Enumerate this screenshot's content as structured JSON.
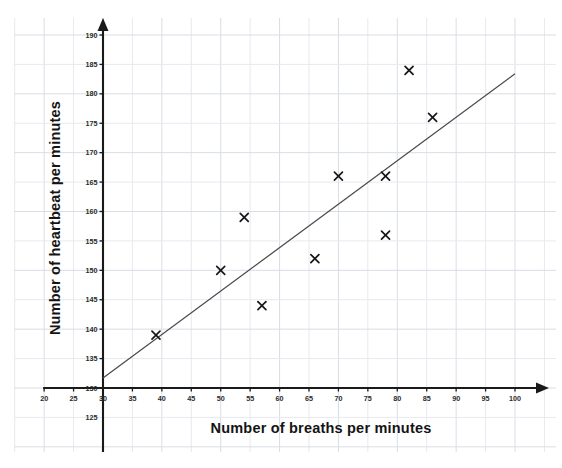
{
  "chart_data": {
    "type": "scatter",
    "title": "",
    "xlabel": "Number of breaths per minutes",
    "ylabel": "Number of heartbeat  per minutes",
    "xlim": [
      20,
      100
    ],
    "ylim": [
      125,
      190
    ],
    "x_ticks": [
      20,
      25,
      30,
      35,
      40,
      45,
      50,
      55,
      60,
      65,
      70,
      75,
      80,
      85,
      90,
      95,
      100
    ],
    "y_ticks": [
      125,
      130,
      135,
      140,
      145,
      150,
      155,
      160,
      165,
      170,
      175,
      180,
      185,
      190
    ],
    "x_tick_labels": [
      "20",
      "25",
      "30",
      "35",
      "40",
      "45",
      "50",
      "55",
      "60",
      "65",
      "70",
      "75",
      "80",
      "85",
      "90",
      "95",
      "100"
    ],
    "y_tick_labels": [
      "125",
      "130",
      "135",
      "140",
      "145",
      "150",
      "155",
      "160",
      "165",
      "170",
      "175",
      "180",
      "185",
      "190"
    ],
    "grid": true,
    "legend": "none",
    "marker_symbol": "x",
    "marker_color": "#171717",
    "origin": [
      30,
      130
    ],
    "axis_arrows": true,
    "points": [
      {
        "x": 39,
        "y": 139
      },
      {
        "x": 50,
        "y": 150
      },
      {
        "x": 54,
        "y": 159
      },
      {
        "x": 57,
        "y": 144
      },
      {
        "x": 66,
        "y": 152
      },
      {
        "x": 70,
        "y": 166
      },
      {
        "x": 78,
        "y": 166
      },
      {
        "x": 78,
        "y": 156
      },
      {
        "x": 82,
        "y": 184
      },
      {
        "x": 86,
        "y": 176
      }
    ],
    "trend_line": {
      "label": "line of best fit",
      "color": "#4a4a4a",
      "start": {
        "x": 30,
        "y": 131.7
      },
      "end": {
        "x": 100,
        "y": 183.4
      }
    }
  }
}
